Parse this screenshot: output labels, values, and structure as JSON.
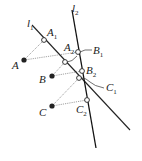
{
  "diagram": {
    "type": "geometry-projection",
    "colors": {
      "line": "#111111",
      "dotted": "#888888",
      "point": "#222222",
      "label": "#222222"
    },
    "lines": [
      {
        "id": "l1",
        "label": "l",
        "sub": "1",
        "from": [
          32,
          25
        ],
        "to": [
          130,
          130
        ]
      },
      {
        "id": "l2",
        "label": "l",
        "sub": "2",
        "from": [
          72,
          10
        ],
        "to": [
          96,
          148
        ]
      }
    ],
    "solid_points": [
      {
        "id": "A",
        "label": "A",
        "at": [
          24,
          60
        ]
      },
      {
        "id": "B",
        "label": "B",
        "at": [
          52,
          76
        ]
      },
      {
        "id": "C",
        "label": "C",
        "at": [
          52,
          106
        ]
      }
    ],
    "hollow_points": [
      {
        "id": "A1",
        "label": "A",
        "sub": "1",
        "at": [
          44,
          40
        ]
      },
      {
        "id": "A2",
        "label": "A",
        "sub": "2",
        "at": [
          78,
          52
        ]
      },
      {
        "id": "B1",
        "label": "B",
        "sub": "1",
        "at": [
          65,
          62
        ]
      },
      {
        "id": "B2",
        "label": "B",
        "sub": "2",
        "at": [
          82,
          71
        ]
      },
      {
        "id": "C1",
        "label": "C",
        "sub": "1",
        "at": [
          79,
          78
        ]
      },
      {
        "id": "C2",
        "label": "C",
        "sub": "2",
        "at": [
          87,
          100
        ]
      }
    ],
    "labels": {
      "l1": {
        "text": "l",
        "sub": "1"
      },
      "l2": {
        "text": "l",
        "sub": "2"
      },
      "A": "A",
      "B": "B",
      "C": "C",
      "A1": {
        "text": "A",
        "sub": "1"
      },
      "A2": {
        "text": "A",
        "sub": "2"
      },
      "B1": {
        "text": "B",
        "sub": "1"
      },
      "B2": {
        "text": "B",
        "sub": "2"
      },
      "C1": {
        "text": "C",
        "sub": "1"
      },
      "C2": {
        "text": "C",
        "sub": "2"
      }
    }
  }
}
